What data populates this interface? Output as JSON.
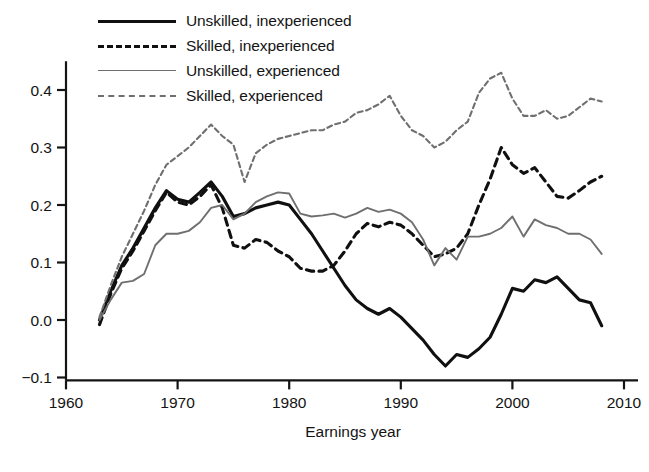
{
  "chart_data": {
    "type": "line",
    "title": "",
    "xlabel": "Earnings year",
    "ylabel": "",
    "xlim": [
      1960,
      2010
    ],
    "ylim": [
      -0.1,
      0.45
    ],
    "xticks": [
      1960,
      1970,
      1980,
      1990,
      2000,
      2010
    ],
    "yticks": [
      -0.1,
      0.0,
      0.1,
      0.2,
      0.3,
      0.4
    ],
    "xtick_labels": [
      "1960",
      "1970",
      "1980",
      "1990",
      "2000",
      "2010"
    ],
    "ytick_labels": [
      "-0.1",
      "0.0",
      "0.1",
      "0.2",
      "0.3",
      "0.4"
    ],
    "grid": false,
    "legend_position": "top-left",
    "x": [
      1963,
      1964,
      1965,
      1966,
      1967,
      1968,
      1969,
      1970,
      1971,
      1972,
      1973,
      1974,
      1975,
      1976,
      1977,
      1978,
      1979,
      1980,
      1981,
      1982,
      1983,
      1984,
      1985,
      1986,
      1987,
      1988,
      1989,
      1990,
      1991,
      1992,
      1993,
      1994,
      1995,
      1996,
      1997,
      1998,
      1999,
      2000,
      2001,
      2002,
      2003,
      2004,
      2005,
      2006,
      2007,
      2008
    ],
    "series": [
      {
        "name": "Unskilled, inexperienced",
        "color": "#101010",
        "style": "solid",
        "width": 3.1,
        "values": [
          0.0,
          0.05,
          0.095,
          0.125,
          0.16,
          0.195,
          0.225,
          0.21,
          0.205,
          0.222,
          0.24,
          0.215,
          0.18,
          0.185,
          0.195,
          0.2,
          0.205,
          0.2,
          0.175,
          0.15,
          0.12,
          0.09,
          0.06,
          0.035,
          0.02,
          0.01,
          0.02,
          0.005,
          -0.015,
          -0.035,
          -0.06,
          -0.08,
          -0.06,
          -0.065,
          -0.05,
          -0.03,
          0.01,
          0.055,
          0.05,
          0.07,
          0.065,
          0.075,
          0.055,
          0.035,
          0.03,
          -0.01
        ]
      },
      {
        "name": "Skilled, inexperienced",
        "color": "#101010",
        "style": "dashed",
        "width": 3.1,
        "values": [
          -0.008,
          0.045,
          0.09,
          0.12,
          0.155,
          0.19,
          0.222,
          0.205,
          0.2,
          0.215,
          0.235,
          0.195,
          0.13,
          0.125,
          0.14,
          0.135,
          0.12,
          0.11,
          0.09,
          0.085,
          0.085,
          0.095,
          0.12,
          0.15,
          0.168,
          0.162,
          0.17,
          0.165,
          0.15,
          0.13,
          0.11,
          0.115,
          0.125,
          0.15,
          0.2,
          0.245,
          0.3,
          0.27,
          0.255,
          0.265,
          0.24,
          0.215,
          0.212,
          0.225,
          0.24,
          0.25
        ]
      },
      {
        "name": "Unskilled, experienced",
        "color": "#6f6f6f",
        "style": "solid",
        "width": 1.9,
        "values": [
          0.0,
          0.035,
          0.065,
          0.068,
          0.08,
          0.13,
          0.15,
          0.15,
          0.155,
          0.17,
          0.195,
          0.2,
          0.175,
          0.185,
          0.205,
          0.215,
          0.222,
          0.22,
          0.185,
          0.18,
          0.182,
          0.185,
          0.178,
          0.185,
          0.195,
          0.188,
          0.192,
          0.185,
          0.17,
          0.14,
          0.095,
          0.125,
          0.105,
          0.145,
          0.145,
          0.15,
          0.16,
          0.18,
          0.145,
          0.175,
          0.165,
          0.16,
          0.15,
          0.15,
          0.14,
          0.115
        ]
      },
      {
        "name": "Skilled, experienced",
        "color": "#6f6f6f",
        "style": "dashed",
        "width": 2.1,
        "values": [
          0.005,
          0.06,
          0.11,
          0.15,
          0.19,
          0.235,
          0.27,
          0.285,
          0.3,
          0.32,
          0.34,
          0.32,
          0.305,
          0.24,
          0.29,
          0.305,
          0.315,
          0.32,
          0.325,
          0.33,
          0.33,
          0.34,
          0.345,
          0.36,
          0.365,
          0.375,
          0.39,
          0.355,
          0.33,
          0.32,
          0.3,
          0.31,
          0.33,
          0.345,
          0.395,
          0.42,
          0.43,
          0.385,
          0.355,
          0.355,
          0.365,
          0.35,
          0.355,
          0.37,
          0.385,
          0.38
        ]
      }
    ]
  }
}
